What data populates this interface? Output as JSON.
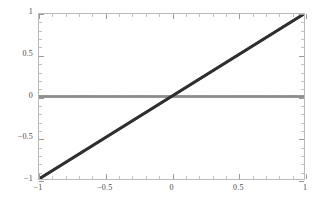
{
  "figure": {
    "background": "#ffffff",
    "frame_color": "#b9b9b9",
    "width": 326,
    "height": 207
  },
  "chart_data": {
    "type": "line",
    "title": "",
    "subtitle": "",
    "xlabel": "",
    "ylabel": "",
    "xlim": [
      -1,
      1
    ],
    "ylim": [
      -1,
      1
    ],
    "grid": false,
    "legend": null,
    "legend_position": "none",
    "frame": true,
    "xticks": [
      -1,
      -0.5,
      0,
      0.5,
      1
    ],
    "xtick_labels": [
      "-1",
      "-0.5",
      "0",
      "0.5",
      "1"
    ],
    "xminor_ticks": [
      -0.9,
      -0.8,
      -0.7,
      -0.6,
      -0.4,
      -0.3,
      -0.2,
      -0.1,
      0.1,
      0.2,
      0.3,
      0.4,
      0.6,
      0.7,
      0.8,
      0.9
    ],
    "yticks": [
      -1,
      -0.5,
      0,
      0.5,
      1
    ],
    "ytick_labels": [
      "-1",
      "-0.5",
      "0",
      "0.5",
      "1"
    ],
    "yminor_ticks": [
      -0.9,
      -0.8,
      -0.7,
      -0.6,
      -0.4,
      -0.3,
      -0.2,
      -0.1,
      0.1,
      0.2,
      0.3,
      0.4,
      0.6,
      0.7,
      0.8,
      0.9
    ],
    "x": [
      -1,
      -0.9,
      -0.8,
      -0.7,
      -0.6,
      -0.5,
      -0.4,
      -0.3,
      -0.2,
      -0.1,
      0,
      0.1,
      0.2,
      0.3,
      0.4,
      0.5,
      0.6,
      0.7,
      0.8,
      0.9,
      1
    ],
    "series": [
      {
        "name": "identity-line",
        "color": "#303030",
        "style": "dotted-dense",
        "values": [
          -1,
          -0.9,
          -0.8,
          -0.7,
          -0.6,
          -0.5,
          -0.4,
          -0.3,
          -0.2,
          -0.1,
          0,
          0.1,
          0.2,
          0.3,
          0.4,
          0.5,
          0.6,
          0.7,
          0.8,
          0.9,
          1
        ]
      },
      {
        "name": "zero-line",
        "color": "#8d8d8d",
        "style": "dotted-dense",
        "values": [
          0,
          0,
          0,
          0,
          0,
          0,
          0,
          0,
          0,
          0,
          0,
          0,
          0,
          0,
          0,
          0,
          0,
          0,
          0,
          0,
          0
        ]
      }
    ]
  }
}
